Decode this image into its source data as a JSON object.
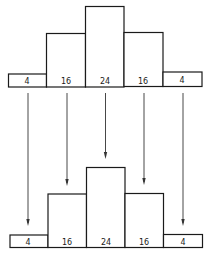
{
  "diagram": {
    "top_histogram": {
      "values": [
        4,
        16,
        24,
        16,
        4
      ],
      "labels": [
        "4",
        "16",
        "24",
        "16",
        "4"
      ]
    },
    "bottom_histogram": {
      "values": [
        4,
        16,
        24,
        16,
        4
      ],
      "labels": [
        "4",
        "16",
        "24",
        "16",
        "4"
      ]
    },
    "arrows": {
      "count": 5,
      "direction": "down"
    },
    "colors": {
      "line": "#1a1a1a",
      "background": "#ffffff"
    }
  }
}
